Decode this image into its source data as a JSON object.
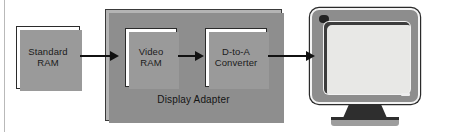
{
  "figure": {
    "background_color": "#ffffff",
    "line_color": "#111111",
    "container_fill": "#b4b4b4",
    "block_fill": "#ffffff",
    "shadow_color": "#9a9a9a"
  },
  "blocks": [
    {
      "id": "standard-ram",
      "label": "Standard\nRAM",
      "inside_container": false
    },
    {
      "id": "video-ram",
      "label": "Video\nRAM",
      "inside_container": true
    },
    {
      "id": "d-to-a-converter",
      "label": "D-to-A\nConverter",
      "inside_container": true
    }
  ],
  "container": {
    "id": "display-adapter",
    "label": "Display Adapter"
  },
  "monitor": {
    "id": "crt-monitor",
    "bezel_color": "#8d8d8d",
    "screen_color": "#e8e8e6",
    "stand_color": "#2e2e2e"
  },
  "arrows": [
    {
      "id": "standard-ram-to-video-ram",
      "from": "standard-ram",
      "to": "video-ram",
      "direction": "right"
    },
    {
      "id": "video-ram-to-d-to-a-converter",
      "from": "video-ram",
      "to": "d-to-a-converter",
      "direction": "right"
    },
    {
      "id": "d-to-a-converter-to-monitor",
      "from": "d-to-a-converter",
      "to": "crt-monitor",
      "direction": "right"
    }
  ]
}
